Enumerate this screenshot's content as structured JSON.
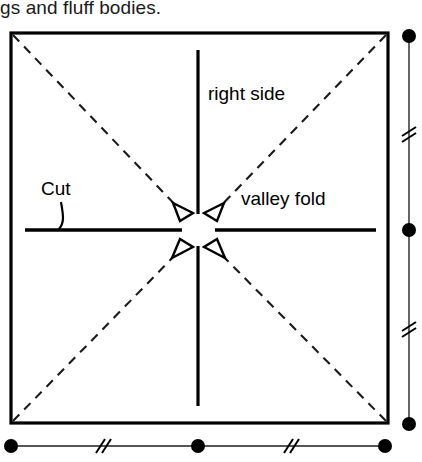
{
  "caption": {
    "text": "gs and fluff bodies."
  },
  "diagram": {
    "labels": {
      "right_side": "right side",
      "valley_fold": "valley fold",
      "cut": "Cut"
    },
    "colors": {
      "stroke": "#000000",
      "background": "#ffffff",
      "dashed_stroke": "#1a1a1a"
    },
    "square": {
      "x": 11,
      "y": 33,
      "width": 377,
      "height": 390
    },
    "center": {
      "x": 198,
      "y": 230
    },
    "vertical_fold_line": {
      "x": 198,
      "y_top": 50,
      "y_bottom": 406
    },
    "horizontal_cut_line": {
      "y": 230,
      "x_left": 25,
      "x_right": 376
    },
    "arrow_count": 4,
    "arrow_directions": [
      "up-left",
      "up-right",
      "down-left",
      "down-right"
    ],
    "diagonals": [
      "top-left-to-bottom-right",
      "top-right-to-bottom-left"
    ]
  },
  "rulers": {
    "right": {
      "orientation": "vertical",
      "x": 409,
      "dots": [
        36,
        230,
        424
      ],
      "break_marks": [
        132,
        327
      ]
    },
    "bottom": {
      "orientation": "horizontal",
      "y": 446,
      "dots": [
        11,
        198,
        385
      ],
      "break_marks": [
        100,
        290
      ]
    }
  }
}
